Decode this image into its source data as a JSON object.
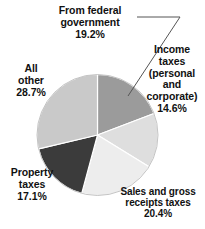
{
  "chart_data": {
    "type": "pie",
    "title": "",
    "subtitle": "",
    "xlabel": "",
    "ylabel": "",
    "legend_position": "none",
    "grid": false,
    "labels_inline": true,
    "categories": [
      "From federal government",
      "Income taxes (personal and corporate)",
      "Sales and gross receipts taxes",
      "Property taxes",
      "All other"
    ],
    "values": [
      19.2,
      14.6,
      20.4,
      17.1,
      28.7
    ],
    "units": "percent",
    "start_angle_deg": 0,
    "direction": "clockwise",
    "slices": [
      {
        "name": "From federal government",
        "value": 19.2,
        "value_label": "19.2%",
        "color": "#9b9b9b",
        "start_deg": 0.0,
        "sweep_deg": 69.12
      },
      {
        "name": "Income taxes (personal and corporate)",
        "value": 14.6,
        "value_label": "14.6%",
        "color": "#dedede",
        "start_deg": 69.12,
        "sweep_deg": 52.56
      },
      {
        "name": "Sales and gross receipts taxes",
        "value": 20.4,
        "value_label": "20.4%",
        "color": "#ededed",
        "start_deg": 121.68,
        "sweep_deg": 73.44
      },
      {
        "name": "Property taxes",
        "value": 17.1,
        "value_label": "17.1%",
        "color": "#3b3b3b",
        "start_deg": 195.12,
        "sweep_deg": 61.56
      },
      {
        "name": "All other",
        "value": 28.7,
        "value_label": "28.7%",
        "color": "#c9c9c9",
        "start_deg": 256.68,
        "sweep_deg": 103.32
      }
    ]
  },
  "labels": {
    "federal": {
      "line1": "From federal",
      "line2": "government",
      "pct": "19.2%"
    },
    "income": {
      "line1": "Income",
      "line2": "taxes",
      "line3": "(personal",
      "line4": "and",
      "line5": "corporate)",
      "pct": "14.6%"
    },
    "sales": {
      "line1": "Sales and gross",
      "line2": "receipts taxes",
      "pct": "20.4%"
    },
    "property": {
      "line1": "Property",
      "line2": "taxes",
      "pct": "17.1%"
    },
    "allother": {
      "line1": "All",
      "line2": "other",
      "pct": "28.7%"
    }
  },
  "colors": {
    "background": "#ffffff",
    "text": "#111111",
    "leader_line": "#555555",
    "slice_outline": "#ffffff"
  }
}
